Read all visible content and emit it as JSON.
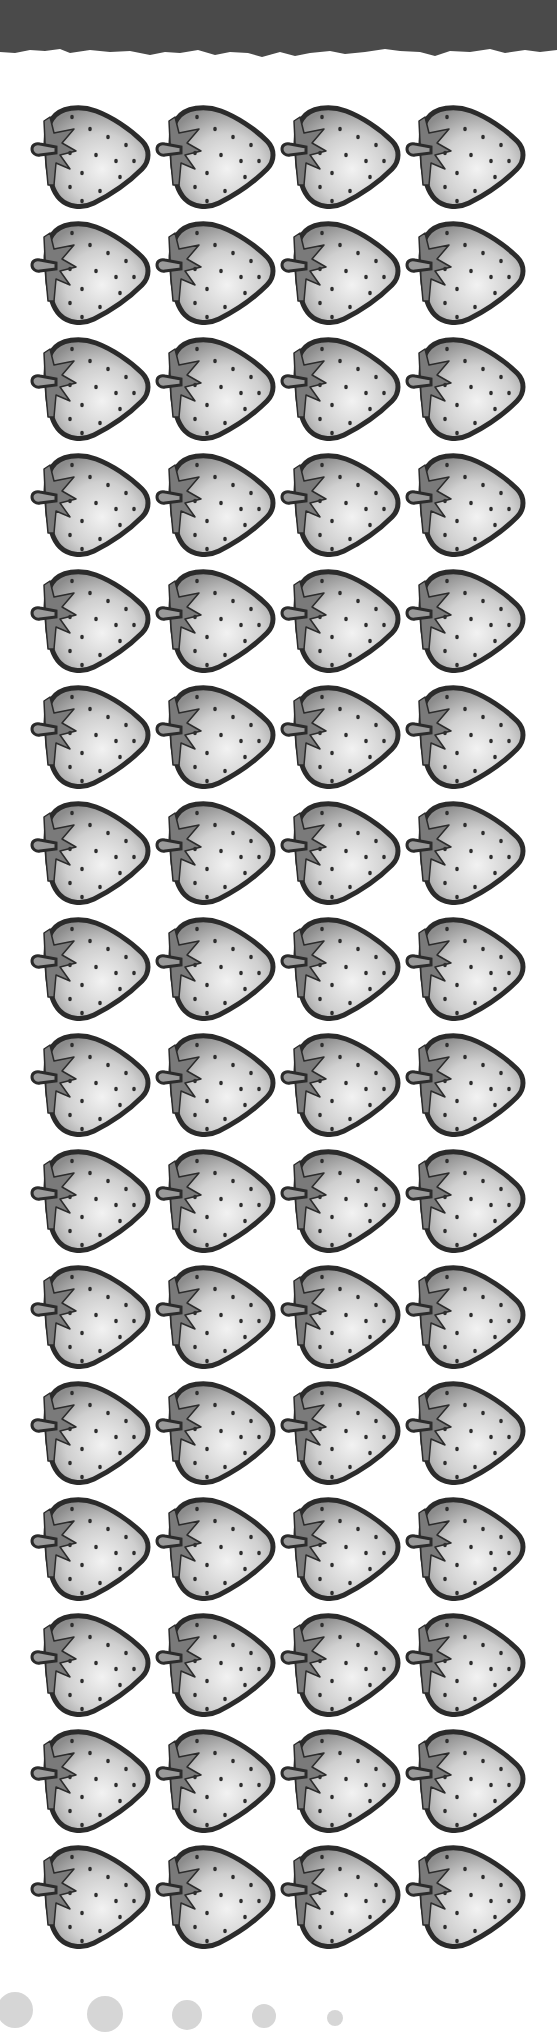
{
  "page": {
    "type": "counting worksheet",
    "background": "#ffffff"
  },
  "header": {
    "band_color": "#4a4a4a",
    "style": "torn-paper edge"
  },
  "grid": {
    "item_icon": "strawberry-icon",
    "rows": 16,
    "columns": 4,
    "total_items": 64,
    "col_x": [
      30,
      155,
      280,
      405
    ],
    "row_y_start": 105,
    "row_pitch": 116,
    "item_width": 122,
    "item_height": 106,
    "colors": {
      "outline": "#2b2b2b",
      "body_dark": "#8c8c8c",
      "body_light": "#f2f2f2",
      "leaf": "#7a7a7a",
      "seed": "#2e2e2e"
    }
  },
  "footer_dots": {
    "icon": "circle-dot-icon",
    "color": "#d6d6d6",
    "items": [
      {
        "cx": 15,
        "r": 18,
        "top": 1992
      },
      {
        "cx": 105,
        "r": 18,
        "top": 1996
      },
      {
        "cx": 187,
        "r": 15,
        "top": 2000
      },
      {
        "cx": 264,
        "r": 12,
        "top": 2004
      },
      {
        "cx": 335,
        "r": 8,
        "top": 2010
      }
    ]
  }
}
